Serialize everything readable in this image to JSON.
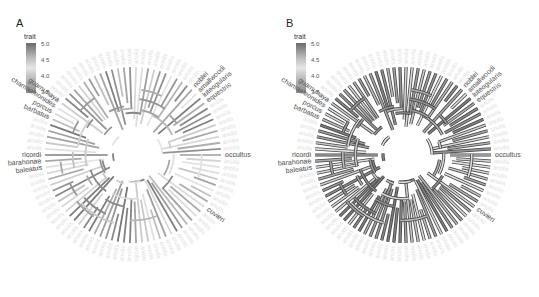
{
  "chart_data": [
    {
      "type": "circular-phylogeny",
      "panel": "A",
      "title": "",
      "legend": {
        "title": "trait",
        "ticks": [
          "5.0",
          "4.5",
          "4.0",
          "3.5"
        ],
        "range": [
          3.5,
          5.0
        ],
        "palette": "grey diverging"
      },
      "style": "branches colored by trait",
      "labels_highlighted": [
        "baleatus",
        "barahonae",
        "ricordi",
        "occultus",
        "barbatus",
        "porcus",
        "chamaeleonides",
        "guamuhaya",
        "equestris",
        "luteogularis",
        "smallwoodi",
        "noblei",
        "cuvieri"
      ]
    },
    {
      "type": "circular-phylogeny",
      "panel": "B",
      "title": "",
      "legend": {
        "title": "trait",
        "ticks": [
          "5.0",
          "4.5",
          "4.0",
          "3.5"
        ],
        "range": [
          3.5,
          5.0
        ],
        "palette": "grey diverging"
      },
      "style": "branches colored by trait with dark outline",
      "labels_highlighted": [
        "baleatus",
        "barahonae",
        "ricordi",
        "occultus",
        "barbatus",
        "porcus",
        "chamaeleonides",
        "guamuhaya",
        "equestris",
        "luteogularis",
        "smallwoodi",
        "noblei",
        "cuvieri"
      ]
    }
  ],
  "panels": {
    "A": {
      "letter": "A",
      "legend_title": "trait",
      "ticks": [
        "5.0",
        "4.5",
        "4.0",
        "3.5"
      ]
    },
    "B": {
      "letter": "B",
      "legend_title": "trait",
      "ticks": [
        "5.0",
        "4.5",
        "4.0",
        "3.5"
      ]
    }
  },
  "tip_labels": {
    "dark": [
      {
        "text": "baleatus",
        "angle": 188
      },
      {
        "text": "barahonae",
        "angle": 184
      },
      {
        "text": "ricordi",
        "angle": 180
      },
      {
        "text": "occultus",
        "angle": 0
      },
      {
        "text": "barbatus",
        "angle": 156
      },
      {
        "text": "porcus",
        "angle": 152
      },
      {
        "text": "chamaeleonides",
        "angle": 148
      },
      {
        "text": "guamuhaya",
        "angle": 144
      },
      {
        "text": "equestris",
        "angle": 36
      },
      {
        "text": "luteogularis",
        "angle": 40
      },
      {
        "text": "smallwoodi",
        "angle": 44
      },
      {
        "text": "noblei",
        "angle": 48
      },
      {
        "text": "cuvieri",
        "angle": 324
      }
    ]
  }
}
